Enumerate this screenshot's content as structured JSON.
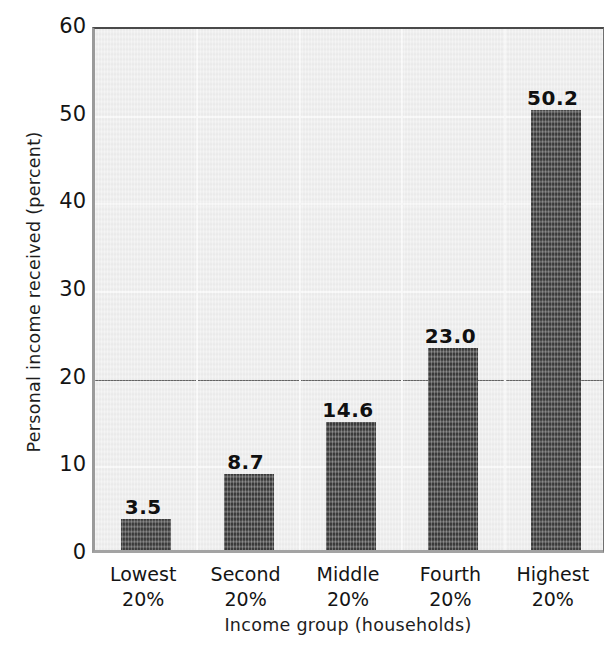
{
  "chart_data": {
    "type": "bar",
    "title": "",
    "subtitle": "",
    "xlabel": "Income group (households)",
    "ylabel": "Personal income received (percent)",
    "categories": [
      "Lowest 20%",
      "Second 20%",
      "Middle 20%",
      "Fourth 20%",
      "Highest 20%"
    ],
    "category_lines": [
      [
        "Lowest",
        "20%"
      ],
      [
        "Second",
        "20%"
      ],
      [
        "Middle",
        "20%"
      ],
      [
        "Fourth",
        "20%"
      ],
      [
        "Highest",
        "20%"
      ]
    ],
    "values": [
      3.5,
      8.7,
      14.6,
      23.0,
      50.2
    ],
    "value_labels": [
      "3.5",
      "8.7",
      "14.6",
      "23.0",
      "50.2"
    ],
    "ylim": [
      0,
      60
    ],
    "xlim_categories": 5,
    "yticks": [
      0,
      10,
      20,
      30,
      40,
      50,
      60
    ],
    "ytick_labels": [
      "0",
      "10",
      "20",
      "30",
      "40",
      "50",
      "60"
    ],
    "grid": "horizontal-and-vertical",
    "reference_line": 20,
    "legend": "none",
    "legend_position": "none",
    "bar_color": "#3a3a3a",
    "plot_background": "#eeeeee",
    "gridline_color": "#f8f8f8",
    "reference_line_color": "#585858",
    "axis_color": "#4a4a4a",
    "text_color": "#141414"
  }
}
